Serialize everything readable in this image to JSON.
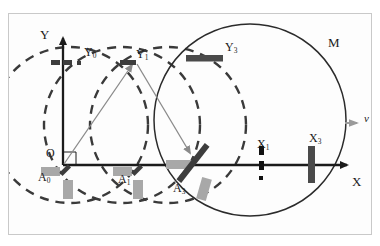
{
  "figure": {
    "type": "physics-optics-diagram",
    "title": "",
    "background": "#ffffff",
    "frame_border_color": "#c9c9c9",
    "width": 380,
    "height": 246
  },
  "palette": {
    "axis": "#1b1b1b",
    "dashed_circle": "#3a3a3a",
    "solid_circle": "#2b2b2b",
    "ray": "#777777",
    "mirror_dark": "#4a4a4a",
    "element_gray": "#a8a8a8",
    "label": "#1b1b1b"
  },
  "axes": {
    "origin_label": "O",
    "x_label": "X",
    "y_label": "Y",
    "origin_px": {
      "x": 63,
      "y": 165
    },
    "x_axis_end_px": {
      "x": 351,
      "y": 165
    },
    "y_axis_end_px": {
      "x": 63,
      "y": 33
    },
    "right_angle_mark": true
  },
  "labels": [
    {
      "id": "Y",
      "text": "Y",
      "sub": "",
      "x": 44,
      "y": 35,
      "size": 13
    },
    {
      "id": "Y0",
      "text": "Y",
      "sub": "0",
      "x": 87,
      "y": 53,
      "size": 12
    },
    {
      "id": "Y1",
      "text": "Y",
      "sub": "1",
      "x": 140,
      "y": 55,
      "size": 12
    },
    {
      "id": "Y3",
      "text": "Y",
      "sub": "3",
      "x": 228,
      "y": 47,
      "size": 12
    },
    {
      "id": "M",
      "text": "M",
      "sub": "",
      "x": 331,
      "y": 42,
      "size": 13
    },
    {
      "id": "v",
      "text": "v",
      "sub": "",
      "x": 367,
      "y": 119,
      "size": 11
    },
    {
      "id": "X1",
      "text": "X",
      "sub": "1",
      "x": 260,
      "y": 146,
      "size": 12
    },
    {
      "id": "X3",
      "text": "X",
      "sub": "3",
      "x": 312,
      "y": 140,
      "size": 12
    },
    {
      "id": "X",
      "text": "X",
      "sub": "",
      "x": 355,
      "y": 182,
      "size": 13
    },
    {
      "id": "O",
      "text": "O",
      "sub": "",
      "x": 48,
      "y": 154,
      "size": 12
    },
    {
      "id": "A0",
      "text": "A",
      "sub": "0",
      "x": 42,
      "y": 177,
      "size": 12
    },
    {
      "id": "A1",
      "text": "A",
      "sub": "1",
      "x": 122,
      "y": 179,
      "size": 12
    },
    {
      "id": "A3",
      "text": "A",
      "sub": "3",
      "x": 177,
      "y": 188,
      "size": 12
    }
  ],
  "dashed_circles": [
    {
      "id": "circle-A0",
      "cx": 70,
      "cy": 125,
      "r": 78,
      "dash": "9 7"
    },
    {
      "id": "circle-A1",
      "cx": 122,
      "cy": 125,
      "r": 78,
      "dash": "9 7"
    },
    {
      "id": "circle-A2",
      "cx": 168,
      "cy": 125,
      "r": 78,
      "dash": "9 7"
    }
  ],
  "solid_circle": {
    "id": "circle-M",
    "cx": 250,
    "cy": 120,
    "r": 96
  },
  "rays": [
    {
      "id": "ray-O-to-Y1",
      "x1": 64,
      "y1": 164,
      "x2": 134,
      "y2": 62
    },
    {
      "id": "ray-Y1-to-A3",
      "x1": 136,
      "y1": 62,
      "x2": 193,
      "y2": 158
    }
  ],
  "ray_arrowheads": [
    {
      "id": "arrowhead-at-Y1",
      "x": 134,
      "y": 62,
      "angle": -55
    },
    {
      "id": "arrowhead-at-A3",
      "x": 192,
      "y": 157,
      "angle": 59
    }
  ],
  "optical_elements": [
    {
      "id": "mirror-Y3",
      "kind": "dark-bar-horizontal",
      "x": 189,
      "y": 58,
      "w": 36,
      "h": 6,
      "rot": 0,
      "color": "#4a4a4a"
    },
    {
      "id": "mirror-Y1",
      "kind": "dark-bar-horizontal",
      "x": 122,
      "y": 62,
      "w": 16,
      "h": 5,
      "rot": 0,
      "color": "#3d3d3d"
    },
    {
      "id": "mark-Y0",
      "kind": "dashed-bar",
      "x": 56,
      "y": 62,
      "w": 35,
      "h": 5,
      "rot": 0,
      "color": "#3d3d3d"
    },
    {
      "id": "beamsplitter-A3",
      "kind": "dark-bar-tilted",
      "x": 193,
      "y": 160,
      "w": 46,
      "h": 6,
      "rot": -52,
      "color": "#3d3d3d"
    },
    {
      "id": "mirror-X3",
      "kind": "dark-bar-vertical",
      "x": 312,
      "y": 164,
      "w": 7,
      "h": 36,
      "rot": 0,
      "color": "#4a4a4a"
    },
    {
      "id": "mark-X1",
      "kind": "dashed-bar-vertical",
      "x": 261,
      "y": 164,
      "w": 5,
      "h": 33,
      "rot": 0,
      "color": "#1b1b1b"
    },
    {
      "id": "source-A0",
      "kind": "gray-block",
      "x": 50,
      "y": 168,
      "w": 18,
      "h": 9,
      "rot": 0,
      "color": "#a8a8a8"
    },
    {
      "id": "detector-A0",
      "kind": "gray-block",
      "x": 67,
      "y": 181,
      "w": 9,
      "h": 17,
      "rot": 0,
      "color": "#a8a8a8"
    },
    {
      "id": "bar-A0",
      "kind": "dark-bar-tilted",
      "x": 66,
      "y": 170,
      "w": 12,
      "h": 4,
      "rot": -48,
      "color": "#3d3d3d"
    },
    {
      "id": "source-A1",
      "kind": "gray-block",
      "x": 122,
      "y": 168,
      "w": 18,
      "h": 9,
      "rot": 0,
      "color": "#a8a8a8"
    },
    {
      "id": "detector-A1",
      "kind": "gray-block",
      "x": 137,
      "y": 181,
      "w": 9,
      "h": 17,
      "rot": 0,
      "color": "#a8a8a8"
    },
    {
      "id": "bar-A1",
      "kind": "dark-bar-tilted",
      "x": 138,
      "y": 170,
      "w": 12,
      "h": 4,
      "rot": -48,
      "color": "#3d3d3d"
    },
    {
      "id": "source-A3",
      "kind": "gray-block",
      "x": 177,
      "y": 163,
      "w": 25,
      "h": 9,
      "rot": 0,
      "color": "#a8a8a8"
    },
    {
      "id": "detector-A3",
      "kind": "gray-block",
      "x": 203,
      "y": 180,
      "w": 9,
      "h": 21,
      "rot": 18,
      "color": "#a8a8a8"
    }
  ],
  "velocity_arrow": {
    "id": "arrow-v",
    "x": 352,
    "y": 123,
    "angle": 0,
    "color": "#9a9a9a"
  },
  "notes": {
    "description": "Schematic of a Michelson-type interferometer drifting along X with velocity v; dashed circles are successive light wavefronts from positions A0, A1, A2; solid circle M is the current wavefront."
  }
}
